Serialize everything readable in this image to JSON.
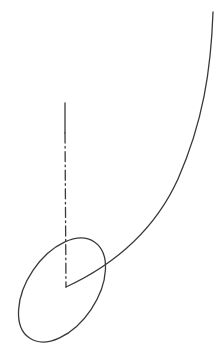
{
  "figure": {
    "width": 222,
    "height": 358,
    "background_color": "#ffffff",
    "stroke_color": "#3a3a3a",
    "stroke_width": 1.3,
    "elements": [
      {
        "name": "ellipse",
        "kind": "ellipse",
        "center_x": 62,
        "center_y": 290,
        "radius_x": 58,
        "radius_y": 35,
        "rotation_deg": -56,
        "line_style": "solid",
        "stroke_color": "#3a3a3a",
        "stroke_width": 1.3
      },
      {
        "name": "centerline",
        "kind": "dash-dot-line",
        "x1": 65,
        "y1": 103,
        "x2": 66,
        "y2": 287,
        "solid_head_length": 30,
        "dash_pattern": "10,3.5,1.6,3.5",
        "line_style": "dash-dot",
        "stroke_color": "#3a3a3a",
        "stroke_width": 1.3
      },
      {
        "name": "curve",
        "kind": "curve",
        "start_x": 213,
        "start_y": 12,
        "end_x": 66,
        "end_y": 287,
        "path": "M 213 12 C 211 70 203 122 178 179 C 157 225 120 262 66 287",
        "line_style": "solid",
        "stroke_color": "#3a3a3a",
        "stroke_width": 1.3
      }
    ]
  },
  "chart_data": {
    "type": "line",
    "xlabel": "",
    "ylabel": "",
    "xlim": [
      0,
      222
    ],
    "ylim": [
      358,
      0
    ],
    "grid": false,
    "legend": "none",
    "series": [
      {
        "name": "curve",
        "style": "solid",
        "x": [
          213,
          212,
          210,
          206,
          200,
          192,
          182,
          170,
          156,
          140,
          122,
          103,
          84,
          66
        ],
        "y": [
          12,
          40,
          68,
          96,
          124,
          151,
          177,
          201,
          223,
          243,
          260,
          273,
          282,
          287
        ]
      },
      {
        "name": "centerline",
        "style": "dash-dot",
        "x": [
          65,
          65,
          66,
          66
        ],
        "y": [
          103,
          180,
          250,
          287
        ]
      },
      {
        "name": "ellipse-outline",
        "style": "solid",
        "center": [
          62,
          290
        ],
        "semi_major": 58,
        "semi_minor": 35,
        "rotation_deg": -56,
        "extents": {
          "leftmost_x": 17,
          "rightmost_x": 106,
          "topmost_y": 234,
          "bottommost_y": 346
        }
      }
    ],
    "annotations": [
      {
        "name": "v-junction",
        "x": 66,
        "y": 287,
        "note": "curve terminates at lower end of centerline forming a V"
      },
      {
        "name": "curve-ellipse-crossing",
        "x": 96,
        "y": 270,
        "note": "curve crosses ellipse outline"
      },
      {
        "name": "centerline-ellipse-crossing",
        "x": 65,
        "y": 237,
        "note": "centerline crosses upper ellipse outline"
      }
    ]
  }
}
